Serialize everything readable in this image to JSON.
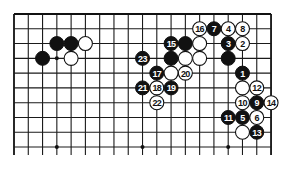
{
  "diagram": {
    "type": "go-board-fragment",
    "board_columns": 19,
    "visible_rows": 10,
    "edges": {
      "top": true,
      "left": true,
      "right": true,
      "bottom": false
    },
    "colors": {
      "line": "#1a1a1a",
      "black": "#111111",
      "white": "#ffffff",
      "background": "#ffffff"
    },
    "hoshi": [
      {
        "col": 4,
        "row": 4
      },
      {
        "col": 10,
        "row": 4
      },
      {
        "col": 16,
        "row": 4
      },
      {
        "col": 4,
        "row": 10
      },
      {
        "col": 10,
        "row": 10
      },
      {
        "col": 16,
        "row": 10
      }
    ],
    "stones": [
      {
        "col": 4,
        "row": 3,
        "color": "black",
        "label": ""
      },
      {
        "col": 5,
        "row": 3,
        "color": "black",
        "label": ""
      },
      {
        "col": 6,
        "row": 3,
        "color": "white",
        "label": ""
      },
      {
        "col": 3,
        "row": 4,
        "color": "black",
        "label": ""
      },
      {
        "col": 5,
        "row": 4,
        "color": "white",
        "label": ""
      },
      {
        "col": 14,
        "row": 2,
        "color": "white",
        "label": "16"
      },
      {
        "col": 15,
        "row": 2,
        "color": "black",
        "label": "7"
      },
      {
        "col": 16,
        "row": 2,
        "color": "white",
        "label": "4"
      },
      {
        "col": 17,
        "row": 2,
        "color": "white",
        "label": "8"
      },
      {
        "col": 12,
        "row": 3,
        "color": "black",
        "label": "15"
      },
      {
        "col": 13,
        "row": 3,
        "color": "black",
        "label": ""
      },
      {
        "col": 14,
        "row": 3,
        "color": "white",
        "label": ""
      },
      {
        "col": 16,
        "row": 3,
        "color": "black",
        "label": "3"
      },
      {
        "col": 17,
        "row": 3,
        "color": "white",
        "label": "2"
      },
      {
        "col": 10,
        "row": 4,
        "color": "black",
        "label": "23"
      },
      {
        "col": 12,
        "row": 4,
        "color": "black",
        "label": ""
      },
      {
        "col": 13,
        "row": 4,
        "color": "white",
        "label": ""
      },
      {
        "col": 14,
        "row": 4,
        "color": "white",
        "label": ""
      },
      {
        "col": 16,
        "row": 4,
        "color": "black",
        "label": ""
      },
      {
        "col": 11,
        "row": 5,
        "color": "black",
        "label": "17"
      },
      {
        "col": 12,
        "row": 5,
        "color": "white",
        "label": ""
      },
      {
        "col": 13,
        "row": 5,
        "color": "white",
        "label": "20"
      },
      {
        "col": 17,
        "row": 5,
        "color": "black",
        "label": "1"
      },
      {
        "col": 10,
        "row": 6,
        "color": "black",
        "label": "21"
      },
      {
        "col": 11,
        "row": 6,
        "color": "white",
        "label": "18"
      },
      {
        "col": 12,
        "row": 6,
        "color": "black",
        "label": "19"
      },
      {
        "col": 17,
        "row": 6,
        "color": "white",
        "label": ""
      },
      {
        "col": 18,
        "row": 6,
        "color": "white",
        "label": "12"
      },
      {
        "col": 11,
        "row": 7,
        "color": "white",
        "label": "22"
      },
      {
        "col": 17,
        "row": 7,
        "color": "white",
        "label": "10"
      },
      {
        "col": 18,
        "row": 7,
        "color": "black",
        "label": "9"
      },
      {
        "col": 19,
        "row": 7,
        "color": "white",
        "label": "14"
      },
      {
        "col": 16,
        "row": 8,
        "color": "black",
        "label": "11"
      },
      {
        "col": 17,
        "row": 8,
        "color": "black",
        "label": "5"
      },
      {
        "col": 18,
        "row": 8,
        "color": "white",
        "label": "6"
      },
      {
        "col": 17,
        "row": 9,
        "color": "white",
        "label": ""
      },
      {
        "col": 18,
        "row": 9,
        "color": "black",
        "label": "13"
      }
    ]
  }
}
